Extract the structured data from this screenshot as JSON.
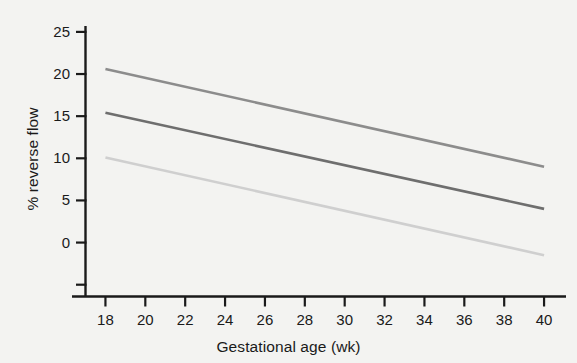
{
  "chart_data": {
    "type": "line",
    "title": "",
    "xlabel": "Gestational age (wk)",
    "ylabel": "% reverse flow",
    "xlim": [
      17.0,
      41.1
    ],
    "ylim": [
      -6.4,
      25.7
    ],
    "xticks": [
      18,
      20,
      22,
      24,
      26,
      28,
      30,
      32,
      34,
      36,
      38,
      40
    ],
    "xtick_labels": [
      "18",
      "20",
      "22",
      "24",
      "26",
      "28",
      "30",
      "32",
      "34",
      "36",
      "38",
      "40"
    ],
    "yticks": [
      -5,
      0,
      5,
      10,
      15,
      20,
      25
    ],
    "ytick_labels": [
      "",
      "0",
      "5",
      "10",
      "15",
      "20",
      "25"
    ],
    "grid": false,
    "legend": "none",
    "x": [
      18,
      40
    ],
    "series": [
      {
        "name": "upper",
        "color": "#8c8c8c",
        "values": [
          20.6,
          9.0
        ]
      },
      {
        "name": "middle",
        "color": "#6e6e6e",
        "values": [
          15.4,
          4.0
        ]
      },
      {
        "name": "lower",
        "color": "#cfcfcf",
        "values": [
          10.1,
          -1.5
        ]
      }
    ]
  },
  "axis": {
    "line_color": "#1a1a1a"
  }
}
